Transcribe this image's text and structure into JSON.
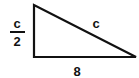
{
  "diagram": {
    "type": "right-triangle",
    "labels": {
      "vertical_side_numerator": "c",
      "vertical_side_denominator": "2",
      "hypotenuse": "c",
      "base": "8"
    },
    "vertices": {
      "top": [
        34,
        5
      ],
      "right_angle": [
        34,
        57
      ],
      "right": [
        136,
        57
      ]
    },
    "stroke_color": "#111111",
    "background": "#ffffff"
  }
}
